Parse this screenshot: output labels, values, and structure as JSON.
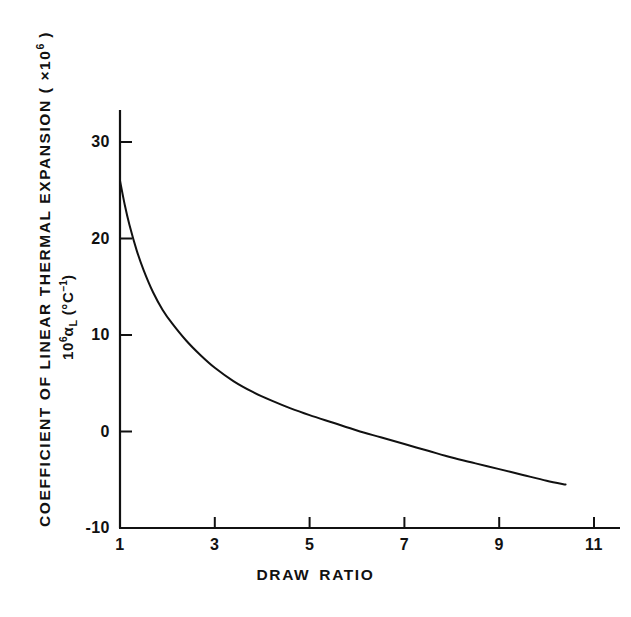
{
  "figure": {
    "background_color": "#ffffff",
    "line_color": "#111111",
    "axis_color": "#111111"
  },
  "labels": {
    "y_outer_prefix": "COEFFICIENT OF LINEAR THERMAL EXPANSION ( ×10",
    "y_outer_sup": "6",
    "y_outer_suffix": " )",
    "y_inner_prefix": "10",
    "y_inner_sup1": "6",
    "y_inner_alpha": "α",
    "y_inner_sub": "L",
    "y_inner_unit_open": " (°C",
    "y_inner_sup2": "−1",
    "y_inner_unit_close": ")",
    "x_word_1": "DRAW",
    "x_word_2": "RATIO",
    "caption_partial": ""
  },
  "chart_data": {
    "type": "line",
    "title": "",
    "subtitle": "",
    "xlabel": "DRAW RATIO",
    "ylabel": "COEFFICIENT OF LINEAR THERMAL EXPANSION ( ×10⁶ )",
    "ylabel_secondary": "10⁶α_L (°C⁻¹)",
    "xlim": [
      1,
      11.6
    ],
    "ylim": [
      -10,
      34
    ],
    "xticks": [
      1,
      3,
      5,
      7,
      9,
      11
    ],
    "xtick_labels": [
      "1",
      "3",
      "5",
      "7",
      "9",
      "11"
    ],
    "yticks": [
      -10,
      0,
      10,
      20,
      30
    ],
    "ytick_labels": [
      "-10",
      "0",
      "10",
      "20",
      "30"
    ],
    "grid": false,
    "legend": null,
    "series": [
      {
        "name": "alpha_L vs draw ratio",
        "x": [
          1.0,
          1.1,
          1.2,
          1.35,
          1.5,
          1.7,
          1.9,
          2.1,
          2.4,
          2.7,
          3.0,
          3.4,
          3.8,
          4.2,
          4.6,
          5.0,
          5.5,
          6.0,
          6.5,
          7.0,
          7.5,
          8.0,
          8.5,
          9.0,
          9.5,
          10.0,
          10.4
        ],
        "y": [
          26.0,
          23.5,
          21.4,
          18.8,
          16.7,
          14.4,
          12.6,
          11.2,
          9.4,
          7.9,
          6.6,
          5.2,
          4.1,
          3.2,
          2.4,
          1.7,
          0.9,
          0.1,
          -0.6,
          -1.3,
          -2.0,
          -2.7,
          -3.3,
          -3.9,
          -4.5,
          -5.1,
          -5.5
        ]
      }
    ]
  },
  "geometry": {
    "x_pixel_min": 120,
    "x_pixel_max": 594,
    "x_value_min": 1,
    "x_value_max": 11,
    "y_pixel_min": 528,
    "y_pixel_max": 142,
    "y_value_min": -10,
    "y_value_max": 30,
    "axis_top_pixel": 110,
    "axis_right_pixel": 620
  }
}
